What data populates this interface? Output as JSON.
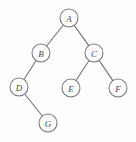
{
  "figure": {
    "type": "binary-tree-diagram",
    "width": 136,
    "height": 142,
    "background_color": "#fefefe",
    "node_fill_color": "#fdfdfd",
    "node_stroke_color": "#7a7a7a",
    "edge_color": "#6e6e6e",
    "label_color": "#4a4a4a",
    "node_radius": 9
  },
  "nodes": [
    {
      "id": "A",
      "label": "A",
      "x": 69,
      "y": 18,
      "role": "root"
    },
    {
      "id": "B",
      "label": "B",
      "x": 41,
      "y": 53,
      "role": "internal"
    },
    {
      "id": "C",
      "label": "C",
      "x": 94,
      "y": 53,
      "role": "internal"
    },
    {
      "id": "D",
      "label": "D",
      "x": 19,
      "y": 87,
      "role": "internal"
    },
    {
      "id": "E",
      "label": "E",
      "x": 71,
      "y": 88,
      "role": "leaf"
    },
    {
      "id": "F",
      "label": "F",
      "x": 118,
      "y": 88,
      "role": "leaf"
    },
    {
      "id": "G",
      "label": "G",
      "x": 48,
      "y": 123,
      "role": "leaf"
    }
  ],
  "edges": [
    {
      "from": "A",
      "to": "B",
      "side": "left"
    },
    {
      "from": "A",
      "to": "C",
      "side": "right"
    },
    {
      "from": "B",
      "to": "D",
      "side": "left"
    },
    {
      "from": "C",
      "to": "E",
      "side": "left"
    },
    {
      "from": "C",
      "to": "F",
      "side": "right"
    },
    {
      "from": "D",
      "to": "G",
      "side": "right"
    }
  ]
}
